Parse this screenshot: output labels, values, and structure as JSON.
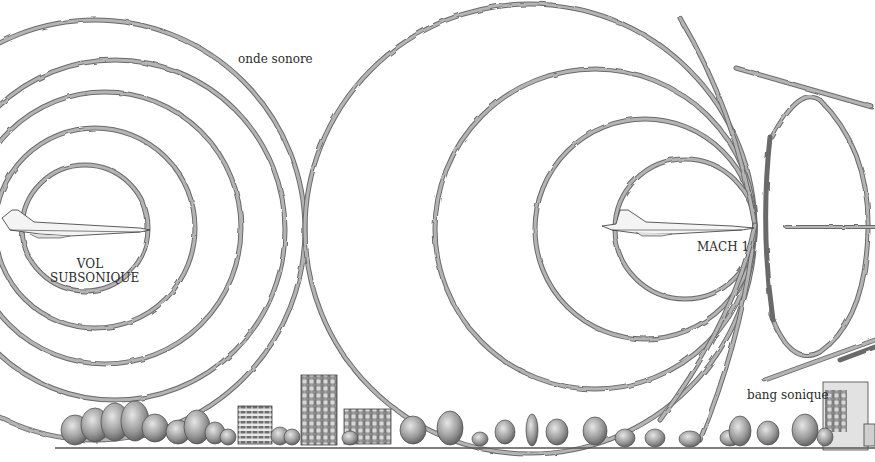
{
  "labels": {
    "sound_wave": "onde sonore",
    "subsonic_line1": "VOL",
    "subsonic_line2": "SUBSONIQUE",
    "mach": "MACH 1",
    "sonic_boom": "bang sonique"
  },
  "scenes": {
    "subsonic": {
      "aircraft": "concorde-icon",
      "wave_count": 5
    },
    "mach1": {
      "aircraft": "concorde-icon",
      "wave_count": 4
    },
    "supersonic_cone": {
      "shape": "ellipse-cone"
    }
  },
  "colors": {
    "background": "#ffffff",
    "wave_outline": "#6a6a6a",
    "wave_fill": "#b4b4b4",
    "text": "#2b2b2b",
    "ground": "#555555",
    "tree": "#8c8c8c",
    "building": "#9a9a9a"
  }
}
